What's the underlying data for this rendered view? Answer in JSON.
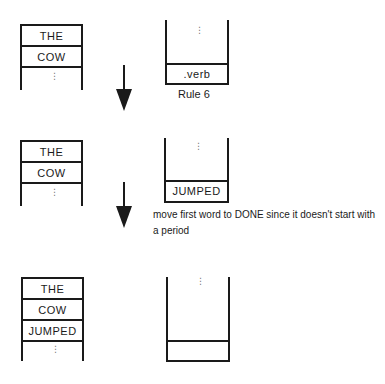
{
  "diagram": {
    "steps": [
      {
        "done_stack": {
          "cells": [
            "THE",
            "COW"
          ],
          "continues": true
        },
        "input_stack": {
          "cells": [
            ".verb"
          ],
          "continues_above": true
        },
        "caption": "Rule 6"
      },
      {
        "done_stack": {
          "cells": [
            "THE",
            "COW"
          ],
          "continues": true
        },
        "input_stack": {
          "cells": [
            "JUMPED"
          ],
          "continues_above": true
        },
        "note": "move first word to DONE since it doesn't start with a period"
      },
      {
        "done_stack": {
          "cells": [
            "THE",
            "COW",
            "JUMPED"
          ],
          "continues": true
        },
        "input_stack": {
          "cells": [
            ""
          ],
          "continues_above": true
        }
      }
    ],
    "arrows": [
      "down-arrow",
      "down-arrow"
    ],
    "ellipsis": "⋮"
  },
  "colors": {
    "line": "#1a1a1a",
    "background": "#ffffff"
  }
}
